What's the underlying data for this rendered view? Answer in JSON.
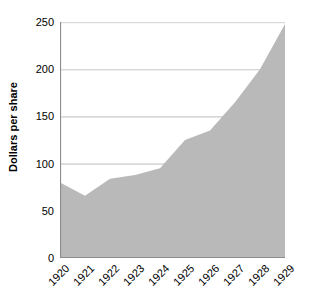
{
  "chart_data": {
    "type": "area",
    "title": "",
    "subtitle": "",
    "xlabel": "",
    "ylabel": "Dollars per share",
    "categories": [
      "1920",
      "1921",
      "1922",
      "1923",
      "1924",
      "1925",
      "1926",
      "1927",
      "1928",
      "1929"
    ],
    "x": [
      1920,
      1921,
      1922,
      1923,
      1924,
      1925,
      1926,
      1927,
      1928,
      1929
    ],
    "values": [
      80,
      66,
      84,
      88,
      95,
      125,
      135,
      165,
      200,
      248
    ],
    "series": [
      {
        "name": "Dollars per share",
        "values": [
          80,
          66,
          84,
          88,
          95,
          125,
          135,
          165,
          200,
          248
        ]
      }
    ],
    "ylim": [
      0,
      250
    ],
    "xlim": [
      1920,
      1929
    ],
    "y_ticks": [
      0,
      50,
      100,
      150,
      200,
      250
    ],
    "y_tick_labels": [
      "0",
      "50",
      "100",
      "150",
      "200",
      "250"
    ],
    "x_tick_labels": [
      "1920",
      "1921",
      "1922",
      "1923",
      "1924",
      "1925",
      "1926",
      "1927",
      "1928",
      "1929"
    ],
    "x_tick_label_rotation": -45,
    "grid": true,
    "grid_axis": "y",
    "legend": false,
    "legend_position": "none",
    "colors": {
      "area_fill": "#b9b9b9",
      "gridline": "#d9d9d9",
      "axis_line": "#8c8c8c",
      "text": "#000000",
      "background": "#ffffff"
    },
    "annotations": []
  }
}
